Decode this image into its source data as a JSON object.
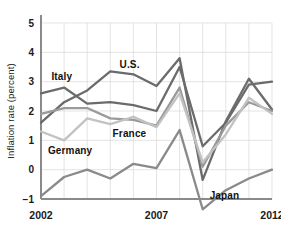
{
  "chart_data": {
    "type": "line",
    "title": "",
    "xlabel": "",
    "ylabel": "Inflation rate (percent)",
    "xlim": [
      2002,
      2012
    ],
    "ylim": [
      -1,
      5
    ],
    "grid": true,
    "legend": "inline-labels",
    "x": [
      2002,
      2003,
      2004,
      2005,
      2006,
      2007,
      2008,
      2009,
      2010,
      2011,
      2012
    ],
    "xticks": [
      "2002",
      "2007",
      "2012"
    ],
    "xtick_values": [
      2002,
      2007,
      2012
    ],
    "yticks": [
      "5",
      "4",
      "3",
      "2",
      "1",
      "0",
      "−1"
    ],
    "ytick_values": [
      5,
      4,
      3,
      2,
      1,
      0,
      -1
    ],
    "series": [
      {
        "name": "Italy",
        "color": "#6b6b6b",
        "values": [
          2.6,
          2.8,
          2.25,
          2.3,
          2.2,
          2.0,
          3.5,
          0.8,
          1.6,
          2.9,
          3.0
        ],
        "label_x": 2002.45,
        "label_y": 3.05
      },
      {
        "name": "U.S.",
        "color": "#6b6b6b",
        "values": [
          1.6,
          2.3,
          2.7,
          3.35,
          3.25,
          2.85,
          3.8,
          -0.35,
          1.65,
          3.1,
          2.05
        ],
        "label_x": 2005.4,
        "label_y": 3.45
      },
      {
        "name": "France",
        "color": "#9a9a9a",
        "values": [
          1.9,
          2.1,
          2.1,
          1.75,
          1.7,
          1.5,
          2.8,
          0.1,
          1.5,
          2.3,
          2.0
        ],
        "label_x": 2005.1,
        "label_y": 1.1
      },
      {
        "name": "Germany",
        "color": "#c2c2c2",
        "values": [
          1.3,
          1.0,
          1.75,
          1.55,
          1.8,
          1.45,
          2.6,
          0.25,
          1.2,
          2.45,
          1.9
        ],
        "label_x": 2002.3,
        "label_y": 0.55
      },
      {
        "name": "Japan",
        "color": "#8a8a8a",
        "values": [
          -0.9,
          -0.25,
          0.0,
          -0.3,
          0.2,
          0.05,
          1.35,
          -1.35,
          -0.7,
          -0.3,
          0.0
        ],
        "label_x": 2009.3,
        "label_y": -1.0
      }
    ]
  }
}
